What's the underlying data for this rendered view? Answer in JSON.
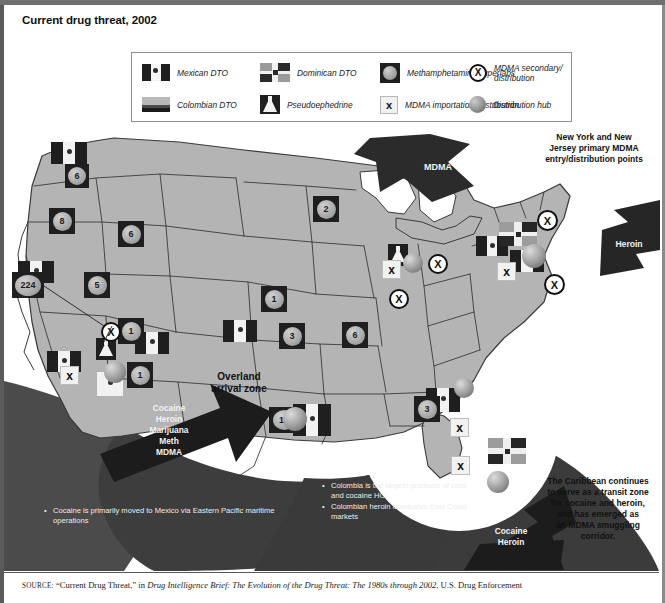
{
  "title": "Current drug threat, 2002",
  "legend": {
    "items": [
      {
        "icon": "mexican-flag-icon",
        "label": "Mexican DTO"
      },
      {
        "icon": "dominican-flag-icon",
        "label": "Dominican DTO"
      },
      {
        "icon": "meth-superlab-icon",
        "label": "Methamphetamine superlabs"
      },
      {
        "icon": "mdma-secondary-icon",
        "label": "MDMA secondary/ distribution"
      },
      {
        "icon": "colombian-flag-icon",
        "label": "Colombian DTO"
      },
      {
        "icon": "pseudoephedrine-icon",
        "label": "Pseudoephedrine"
      },
      {
        "icon": "mdma-importation-icon",
        "label": "MDMA importation/ distribution"
      },
      {
        "icon": "distribution-hub-icon",
        "label": "Distribution hub"
      }
    ]
  },
  "map": {
    "overland_label": "Overland\narrival zone",
    "overland_line1": "Overland",
    "overland_line2": "arrival zone",
    "arrows": [
      {
        "name": "mdma-arrow",
        "label": "MDMA"
      },
      {
        "name": "heroin-arrow",
        "label": "Heroin"
      },
      {
        "name": "pacific-arrow",
        "label": "Cocaine\nHeroin\nMarijuana\nMeth\nMDMA"
      },
      {
        "name": "caribbean-arrow",
        "label": "Cocaine\nHeroin"
      }
    ],
    "pacific_arrow_lines": [
      "Cocaine",
      "Heroin",
      "Marijuana",
      "Meth",
      "MDMA"
    ],
    "caribbean_arrow_lines": [
      "Cocaine",
      "Heroin"
    ],
    "annotations": {
      "ny_nj": "New York and New\nJersey primary MDMA\nentry/distribution points",
      "ny_nj_lines": [
        "New York and New",
        "Jersey primary MDMA",
        "entry/distribution points"
      ],
      "caribbean_lines": [
        "The Caribbean continues",
        "to serve as a transit zone",
        "for cocaine and heroin,",
        "and has emerged as",
        "an MDMA smuggling",
        "corridor."
      ],
      "pacific_bullets": [
        "Cocaine is primarily moved to Mexico via Eastern Pacific maritime operations"
      ],
      "colombia_bullets": [
        "Colombia is the largest producer of coca and cocaine HCl",
        "Colombian heroin dominates East Coast markets"
      ]
    },
    "meth_superlabs": [
      {
        "state": "WA",
        "count": "6",
        "x": 61,
        "y": 38
      },
      {
        "state": "OR",
        "count": "8",
        "x": 47,
        "y": 82
      },
      {
        "state": "ID",
        "count": "6",
        "x": 114,
        "y": 97
      },
      {
        "state": "CA",
        "count": "224",
        "x": 11,
        "y": 148
      },
      {
        "state": "NV",
        "count": "5",
        "x": 82,
        "y": 148
      },
      {
        "state": "MN",
        "count": "2",
        "x": 311,
        "y": 72
      },
      {
        "state": "AZ",
        "count": "1",
        "x": 116,
        "y": 194
      },
      {
        "state": "UT",
        "count": "1",
        "x": 125,
        "y": 238
      },
      {
        "state": "NE",
        "count": "1",
        "x": 259,
        "y": 162
      },
      {
        "state": "KS",
        "count": "3",
        "x": 277,
        "y": 199
      },
      {
        "state": "MO",
        "count": "6",
        "x": 340,
        "y": 198
      },
      {
        "state": "OK",
        "count": "17",
        "x": 267,
        "y": 283
      },
      {
        "state": "TN",
        "count": "3",
        "x": 412,
        "y": 272
      }
    ],
    "mexican_dto": [
      {
        "x": 47,
        "y": 16
      },
      {
        "x": 14,
        "y": 135
      },
      {
        "x": 50,
        "y": 225
      },
      {
        "x": 93,
        "y": 246
      },
      {
        "x": 137,
        "y": 206
      },
      {
        "x": 225,
        "y": 196
      },
      {
        "x": 291,
        "y": 284
      },
      {
        "x": 424,
        "y": 265
      },
      {
        "x": 474,
        "y": 113
      },
      {
        "x": 508,
        "y": 127
      }
    ],
    "dominican_dto": [
      {
        "x": 497,
        "y": 100
      },
      {
        "x": 487,
        "y": 316
      }
    ],
    "pseudoephedrine": [
      {
        "x": 97,
        "y": 216
      },
      {
        "x": 388,
        "y": 100
      }
    ],
    "mdma_importation": [
      {
        "x": 60,
        "y": 245
      },
      {
        "x": 382,
        "y": 138
      },
      {
        "x": 497,
        "y": 140
      },
      {
        "x": 450,
        "y": 296
      },
      {
        "x": 451,
        "y": 334
      }
    ],
    "mdma_secondary": [
      {
        "x": 99,
        "y": 203
      },
      {
        "x": 102,
        "y": 198
      },
      {
        "x": 389,
        "y": 167
      },
      {
        "x": 428,
        "y": 132
      },
      {
        "x": 537,
        "y": 88
      },
      {
        "x": 544,
        "y": 152
      }
    ],
    "distribution_hubs": [
      {
        "x": 106,
        "y": 241
      },
      {
        "x": 405,
        "y": 133
      },
      {
        "x": 526,
        "y": 126
      },
      {
        "x": 286,
        "y": 288
      },
      {
        "x": 456,
        "y": 258
      },
      {
        "x": 489,
        "y": 351
      }
    ]
  },
  "source": {
    "prefix": "SOURCE:",
    "quoted": "“Current Drug Threat,”",
    "connector": " in ",
    "italic": "Drug Intelligence Brief: The Evolution of the Drug Threat: The 1980s through 2002",
    "tail": ", U.S. Drug Enforcement"
  },
  "colors": {
    "land": "#b4b4b4",
    "ocean": "#ffffff",
    "dark": "#2b2b2b",
    "border": "#2f2f2f"
  }
}
